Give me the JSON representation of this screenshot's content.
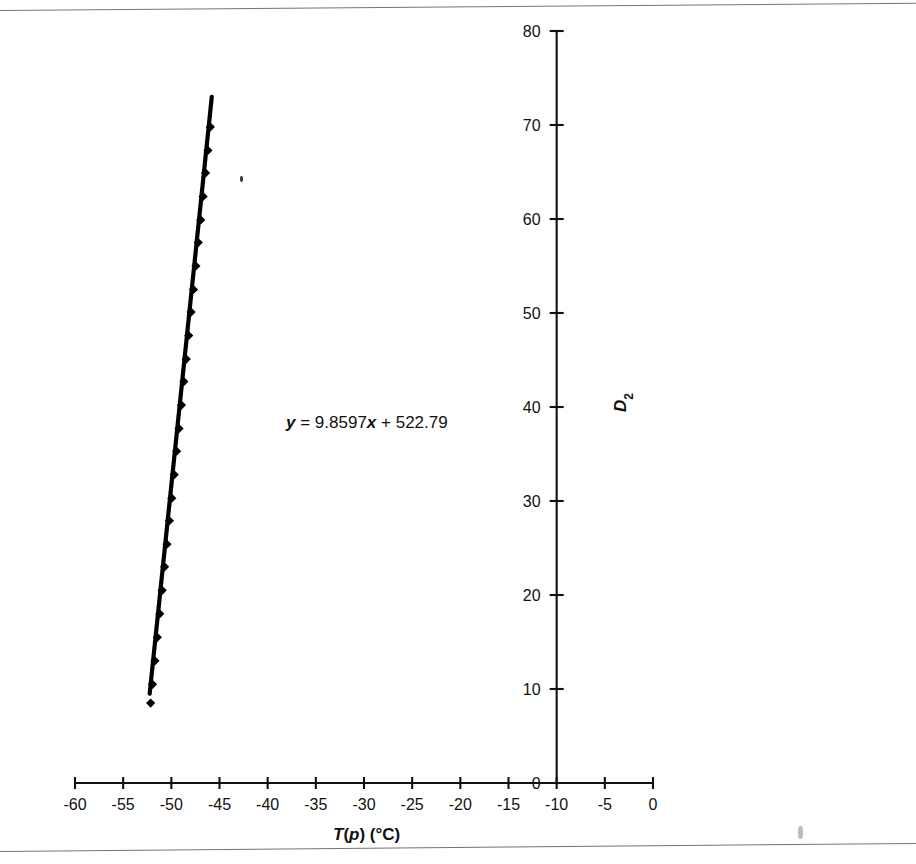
{
  "figure": {
    "background": "#ffffff",
    "ink_color": "#111111",
    "scan_artifacts": {
      "top_rule": true,
      "bottom_rule": true,
      "speck_right": true,
      "speck_plot": true
    }
  },
  "chart_data": {
    "type": "scatter",
    "title": "",
    "xlabel_parts": {
      "symbol": "T(p)",
      "units": "(°C)"
    },
    "xlabel": "T(p)  (°C)",
    "ylabel": "D2",
    "ylabel_rotated": true,
    "annotation": {
      "text": "y = 9.8597x + 522.79",
      "slope": 9.8597,
      "intercept": 522.79,
      "y_var": "y",
      "x_var": "x"
    },
    "xlim": [
      -60,
      0
    ],
    "ylim": [
      0,
      80
    ],
    "xticks": [
      -60,
      -55,
      -50,
      -45,
      -40,
      -35,
      -30,
      -25,
      -20,
      -15,
      -10,
      -5,
      0
    ],
    "xticklabels": [
      "-60",
      "-55",
      "-50",
      "-45",
      "-40",
      "-35",
      "-30",
      "-25",
      "-20",
      "-15",
      "-10",
      "-5",
      "0"
    ],
    "yticks": [
      0,
      10,
      20,
      30,
      40,
      50,
      60,
      70,
      80
    ],
    "yticklabels": [
      "0",
      "10",
      "20",
      "30",
      "40",
      "50",
      "60",
      "70",
      "80"
    ],
    "grid": false,
    "legend": false,
    "y_axis_position_x": -10,
    "series": [
      {
        "name": "D2 vs T(p)",
        "marker": "diamond",
        "color": "#000000",
        "line": "trendline",
        "x": [
          -52.15,
          -51.95,
          -51.7,
          -51.45,
          -51.2,
          -50.95,
          -50.7,
          -50.45,
          -50.2,
          -49.95,
          -49.7,
          -49.45,
          -49.2,
          -48.95,
          -48.7,
          -48.45,
          -48.2,
          -47.95,
          -47.7,
          -47.45,
          -47.2,
          -46.95,
          -46.7,
          -46.45,
          -46.2,
          -45.95
        ],
        "y": [
          8.5,
          10.5,
          13.0,
          15.5,
          18.0,
          20.5,
          23.0,
          25.4,
          27.9,
          30.3,
          32.8,
          35.3,
          37.7,
          40.2,
          42.7,
          45.1,
          47.6,
          50.1,
          52.5,
          55.0,
          57.5,
          59.9,
          62.4,
          64.9,
          67.3,
          69.8
        ]
      }
    ],
    "trendline": {
      "x_start": -52.25,
      "y_start": 9.5,
      "x_end": -45.8,
      "y_end": 73.0
    }
  }
}
